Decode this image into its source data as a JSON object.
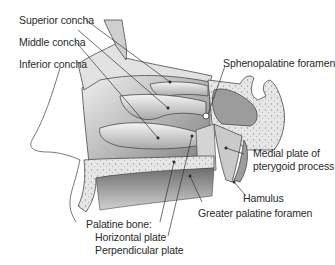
{
  "figure": {
    "labels": {
      "superior_concha": "Superior concha",
      "middle_concha": "Middle concha",
      "inferior_concha": "Inferior concha",
      "sphenopalatine_foramen": "Sphenopalatine foramen",
      "medial_plate_line1": "Medial plate of",
      "medial_plate_line2": "pterygoid process",
      "hamulus": "Hamulus",
      "greater_palatine_foramen": "Greater palatine foramen",
      "palatine_bone": "Palatine bone:",
      "horizontal_plate": "Horizontal plate",
      "perpendicular_plate": "Perpendicular plate"
    },
    "colors": {
      "background": "#ffffff",
      "text": "#2a2a2a",
      "outline": "#4a4a4a",
      "bone_light": "#e4e4e4",
      "cavity_dark": "#8a8a8a"
    }
  }
}
